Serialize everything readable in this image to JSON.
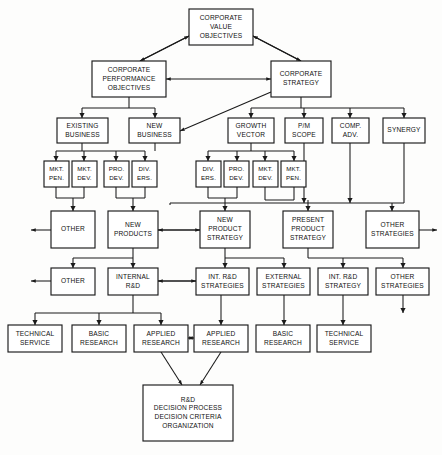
{
  "diagram": {
    "style": {
      "background": "#fdfdfc",
      "box_fill": "#ffffff",
      "line_color": "#1a1a1a",
      "text_color": "#111111"
    },
    "nodes": [
      {
        "id": "corporate-value-objectives",
        "lines": [
          "CORPORATE",
          "VALUE",
          "OBJECTIVES"
        ],
        "x": 189,
        "y": 9,
        "w": 64,
        "h": 36,
        "font": 6.6
      },
      {
        "id": "corporate-performance-objectives",
        "lines": [
          "CORPORATE",
          "PERFORMANCE",
          "OBJECTIVES"
        ],
        "x": 92,
        "y": 61,
        "w": 74,
        "h": 36,
        "font": 6.6
      },
      {
        "id": "corporate-strategy",
        "lines": [
          "CORPORATE",
          "STRATEGY"
        ],
        "x": 271,
        "y": 61,
        "w": 60,
        "h": 36,
        "font": 6.6
      },
      {
        "id": "existing-business",
        "lines": [
          "EXISTING",
          "BUSINESS"
        ],
        "x": 57,
        "y": 118,
        "w": 51,
        "h": 25,
        "font": 6.6
      },
      {
        "id": "new-business",
        "lines": [
          "NEW",
          "BUSINESS"
        ],
        "x": 129,
        "y": 118,
        "w": 51,
        "h": 25,
        "font": 6.6
      },
      {
        "id": "growth-vector",
        "lines": [
          "GROWTH",
          "VECTOR"
        ],
        "x": 228,
        "y": 118,
        "w": 46,
        "h": 25,
        "font": 6.6
      },
      {
        "id": "pm-scope",
        "lines": [
          "P/M",
          "SCOPE"
        ],
        "x": 285,
        "y": 118,
        "w": 38,
        "h": 25,
        "font": 6.6
      },
      {
        "id": "comp-adv",
        "lines": [
          "COMP.",
          "ADV."
        ],
        "x": 332,
        "y": 118,
        "w": 37,
        "h": 25,
        "font": 6.6
      },
      {
        "id": "synergy",
        "lines": [
          "SYNERGY"
        ],
        "x": 383,
        "y": 118,
        "w": 42,
        "h": 25,
        "font": 6.6
      },
      {
        "id": "mkt-pen-left",
        "lines": [
          "MKT.",
          "PEN."
        ],
        "x": 44,
        "y": 161,
        "w": 25,
        "h": 26,
        "font": 6.2
      },
      {
        "id": "mkt-dev-left",
        "lines": [
          "MKT.",
          "DEV."
        ],
        "x": 72,
        "y": 161,
        "w": 25,
        "h": 26,
        "font": 6.2
      },
      {
        "id": "prod-dev-left",
        "lines": [
          "PRO.",
          "DEV."
        ],
        "x": 104,
        "y": 161,
        "w": 25,
        "h": 26,
        "font": 6.2
      },
      {
        "id": "div-ers-left",
        "lines": [
          "DIV.",
          "ERS."
        ],
        "x": 132,
        "y": 161,
        "w": 25,
        "h": 26,
        "font": 6.2
      },
      {
        "id": "div-ers-right",
        "lines": [
          "DIV.",
          "ERS."
        ],
        "x": 196,
        "y": 161,
        "w": 25,
        "h": 26,
        "font": 6.2
      },
      {
        "id": "prod-dev-right",
        "lines": [
          "PRO.",
          "DEV."
        ],
        "x": 224,
        "y": 161,
        "w": 25,
        "h": 26,
        "font": 6.2
      },
      {
        "id": "mkt-dev-right",
        "lines": [
          "MKT.",
          "DEV."
        ],
        "x": 253,
        "y": 161,
        "w": 25,
        "h": 26,
        "font": 6.2
      },
      {
        "id": "mkt-pen-right",
        "lines": [
          "MKT.",
          "PEN."
        ],
        "x": 281,
        "y": 161,
        "w": 25,
        "h": 26,
        "font": 6.2
      },
      {
        "id": "other-row5",
        "lines": [
          "OTHER"
        ],
        "x": 51,
        "y": 211,
        "w": 44,
        "h": 37,
        "font": 6.6
      },
      {
        "id": "new-products",
        "lines": [
          "NEW",
          "PRODUCTS"
        ],
        "x": 108,
        "y": 211,
        "w": 50,
        "h": 37,
        "font": 6.6
      },
      {
        "id": "new-product-strategy",
        "lines": [
          "NEW",
          "PRODUCT",
          "STRATEGY"
        ],
        "x": 200,
        "y": 211,
        "w": 50,
        "h": 37,
        "font": 6.6
      },
      {
        "id": "present-product-strategy",
        "lines": [
          "PRESENT",
          "PRODUCT",
          "STRATEGY"
        ],
        "x": 283,
        "y": 211,
        "w": 50,
        "h": 37,
        "font": 6.6
      },
      {
        "id": "other-strategies-row5",
        "lines": [
          "OTHER",
          "STRATEGIES"
        ],
        "x": 366,
        "y": 211,
        "w": 53,
        "h": 37,
        "font": 6.6
      },
      {
        "id": "other-row6",
        "lines": [
          "OTHER"
        ],
        "x": 51,
        "y": 268,
        "w": 44,
        "h": 27,
        "font": 6.6
      },
      {
        "id": "internal-rd",
        "lines": [
          "INTERNAL",
          "R&D"
        ],
        "x": 108,
        "y": 268,
        "w": 50,
        "h": 27,
        "font": 6.6
      },
      {
        "id": "int-rd-strategies",
        "lines": [
          "INT. R&D",
          "STRATEGIES"
        ],
        "x": 196,
        "y": 268,
        "w": 53,
        "h": 27,
        "font": 6.6
      },
      {
        "id": "external-strategies",
        "lines": [
          "EXTERNAL",
          "STRATEGIES"
        ],
        "x": 257,
        "y": 268,
        "w": 53,
        "h": 27,
        "font": 6.6
      },
      {
        "id": "int-rd-strategy",
        "lines": [
          "INT. R&D",
          "STRATEGY"
        ],
        "x": 318,
        "y": 268,
        "w": 50,
        "h": 27,
        "font": 6.6
      },
      {
        "id": "other-strategies-row6",
        "lines": [
          "OTHER",
          "STRATEGIES"
        ],
        "x": 376,
        "y": 268,
        "w": 53,
        "h": 27,
        "font": 6.6
      },
      {
        "id": "technical-service-left",
        "lines": [
          "TECHNICAL",
          "SERVICE"
        ],
        "x": 8,
        "y": 325,
        "w": 54,
        "h": 27,
        "font": 6.6
      },
      {
        "id": "basic-research-left",
        "lines": [
          "BASIC",
          "RESEARCH"
        ],
        "x": 72,
        "y": 325,
        "w": 54,
        "h": 27,
        "font": 6.6
      },
      {
        "id": "applied-research-left",
        "lines": [
          "APPLIED",
          "RESEARCH"
        ],
        "x": 134,
        "y": 325,
        "w": 54,
        "h": 27,
        "font": 6.6
      },
      {
        "id": "applied-research-right",
        "lines": [
          "APPLIED",
          "RESEARCH"
        ],
        "x": 194,
        "y": 325,
        "w": 54,
        "h": 27,
        "font": 6.6
      },
      {
        "id": "basic-research-right",
        "lines": [
          "BASIC",
          "RESEARCH"
        ],
        "x": 256,
        "y": 325,
        "w": 54,
        "h": 27,
        "font": 6.6
      },
      {
        "id": "technical-service-right",
        "lines": [
          "TECHNICAL",
          "SERVICE"
        ],
        "x": 317,
        "y": 325,
        "w": 54,
        "h": 27,
        "font": 6.6
      },
      {
        "id": "rd-decision",
        "lines": [
          "R&D",
          "DECISION  PROCESS",
          "DECISION  CRITERIA",
          "ORGANIZATION"
        ],
        "x": 143,
        "y": 385,
        "w": 90,
        "h": 56,
        "font": 6.6
      }
    ],
    "connectors": [
      {
        "id": "cvo-to-cpo",
        "d": "M 189 36 L 140 61",
        "arrow_end": true
      },
      {
        "id": "cvo-to-cs",
        "d": "M 253 36 L 301 61",
        "arrow_end": true
      },
      {
        "id": "cvo-from-cpo",
        "d": "M 140 61 L 189 36",
        "arrow_end": true
      },
      {
        "id": "cvo-from-cs",
        "d": "M 301 61 L 253 36",
        "arrow_end": true
      },
      {
        "id": "cpo-cs-link",
        "d": "M 166 79 L 271 79",
        "arrow_end": true,
        "arrow_start": true
      },
      {
        "id": "cpo-bus",
        "d": "M 129 97 L 129 108 M 82 108 L 155 108 M 82 108 L 82 118 M 155 108 L 155 118",
        "arrow_targets": [
          [
            82,
            118
          ],
          [
            155,
            118
          ]
        ]
      },
      {
        "id": "cs-bus",
        "d": "M 301 97 L 301 108 M 251 108 L 404 108 M 251 108 L 251 118 M 304 108 L 304 118 M 350 108 L 350 118 M 404 108 L 404 118",
        "arrow_targets": [
          [
            251,
            118
          ],
          [
            304,
            118
          ],
          [
            350,
            118
          ],
          [
            404,
            118
          ]
        ]
      },
      {
        "id": "cs-to-new-business",
        "d": "M 271 92 L 180 131",
        "arrow_end": true
      },
      {
        "id": "left-small-bus",
        "d": "M 82 143 L 82 151 M 56 151 L 145 151 M 56 151 L 56 161 M 84 151 L 84 161 M 116 151 L 116 161 M 145 151 L 145 161",
        "arrow_targets": [
          [
            56,
            161
          ],
          [
            84,
            161
          ],
          [
            116,
            161
          ],
          [
            145,
            161
          ]
        ]
      },
      {
        "id": "left-small-bus-b",
        "d": "M 155 143 L 155 151",
        "arrow_targets": []
      },
      {
        "id": "right-small-bus",
        "d": "M 251 143 L 251 151 M 208 151 L 294 151 M 208 151 L 208 161 M 237 151 L 237 161 M 265 151 L 265 161 M 294 151 L 294 161",
        "arrow_targets": [
          [
            208,
            161
          ],
          [
            237,
            161
          ],
          [
            265,
            161
          ],
          [
            294,
            161
          ]
        ]
      },
      {
        "id": "merge-other5",
        "d": "M 56 187 L 56 198 M 56 198 L 84 198 M 84 198 L 84 187 M 73 198 L 73 211",
        "arrow_targets": [
          [
            73,
            211
          ]
        ]
      },
      {
        "id": "merge-newproducts",
        "d": "M 116 187 L 116 198 M 116 198 L 145 198 M 145 198 L 145 187 M 133 198 L 133 211",
        "arrow_targets": [
          [
            133,
            211
          ]
        ]
      },
      {
        "id": "merge-nps",
        "d": "M 208 187 L 208 198 M 208 198 L 237 198 M 237 198 L 237 187 M 225 198 L 225 211",
        "arrow_targets": [
          [
            225,
            211
          ]
        ]
      },
      {
        "id": "merge-pps",
        "d": "M 265 187 L 265 200 M 265 200 L 294 200 M 294 200 L 294 187 M 308 200 L 308 211",
        "arrow_targets": [
          [
            308,
            211
          ]
        ]
      },
      {
        "id": "right-top-bus",
        "d": "M 304 143 L 304 203 M 350 143 L 350 203 M 404 143 L 404 203 M 170 203 L 404 203 M 170 203 L 170 205 M 392 203 L 392 211",
        "arrow_targets": [
          [
            304,
            203
          ],
          [
            350,
            203
          ],
          [
            392,
            211
          ]
        ]
      },
      {
        "id": "other5-out",
        "d": "M 51 230 L 31 230",
        "arrow_end": true
      },
      {
        "id": "np-to-nps",
        "d": "M 200 230 L 158 230",
        "arrow_end": true
      },
      {
        "id": "nps-to-np",
        "d": "M 158 230 L 200 230",
        "arrow_end": true
      },
      {
        "id": "os5-out",
        "d": "M 419 230 L 437 230",
        "arrow_end": true
      },
      {
        "id": "np-down-bus",
        "d": "M 133 248 L 133 258 M 73 258 L 133 258 M 73 258 L 73 268 M 133 258 L 133 268",
        "arrow_targets": [
          [
            73,
            268
          ],
          [
            133,
            268
          ]
        ]
      },
      {
        "id": "nps-down-bus",
        "d": "M 225 248 L 225 258 M 225 258 L 284 258 M 225 258 L 225 268 M 284 258 L 284 268",
        "arrow_targets": [
          [
            225,
            268
          ],
          [
            284,
            268
          ]
        ]
      },
      {
        "id": "pps-down-bus",
        "d": "M 308 248 L 308 258 M 308 258 L 403 258 M 343 258 L 343 268 M 403 258 L 403 268",
        "arrow_targets": [
          [
            343,
            268
          ],
          [
            403,
            268
          ]
        ]
      },
      {
        "id": "other6-out",
        "d": "M 51 281 L 31 281",
        "arrow_end": true
      },
      {
        "id": "ird-to-irds",
        "d": "M 196 281 L 158 281",
        "arrow_end": true
      },
      {
        "id": "irds-to-ird",
        "d": "M 158 281 L 196 281",
        "arrow_end": true
      },
      {
        "id": "ird-bottom-bus",
        "d": "M 133 295 L 133 313 M 35 313 L 161 313 M 35 313 L 35 325 M 99 313 L 99 325 M 161 313 L 161 325",
        "arrow_targets": [
          [
            35,
            325
          ],
          [
            99,
            325
          ],
          [
            161,
            325
          ]
        ]
      },
      {
        "id": "irds-bottom",
        "d": "M 221 295 L 221 325",
        "arrow_targets": [
          [
            221,
            325
          ]
        ]
      },
      {
        "id": "ext-bottom",
        "d": "M 284 295 L 284 325",
        "arrow_targets": [
          [
            284,
            325
          ]
        ]
      },
      {
        "id": "irdstrat-bottom",
        "d": "M 343 295 L 343 325",
        "arrow_targets": [
          [
            343,
            325
          ]
        ]
      },
      {
        "id": "os6-bottom",
        "d": "M 403 295 L 403 313",
        "arrow_targets": [
          [
            403,
            313
          ]
        ]
      },
      {
        "id": "applied-link",
        "d": "M 188 338 L 194 338",
        "arrow_end": true,
        "arrow_start": true
      },
      {
        "id": "applied-left-to-rd",
        "d": "M 161 352 L 182 385",
        "arrow_end": true
      },
      {
        "id": "applied-right-to-rd",
        "d": "M 221 352 L 200 385",
        "arrow_end": true
      }
    ]
  }
}
